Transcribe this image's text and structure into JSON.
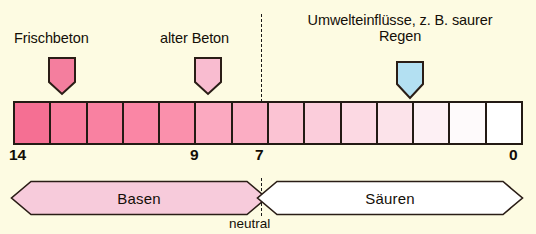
{
  "figure": {
    "background_color": "#fdfbe2",
    "ink_color": "#231a14"
  },
  "callouts": [
    {
      "id": "frischbeton",
      "label": "Frischbeton",
      "marker_icon": "down-pointer-icon",
      "marker_color": "#f47e9e",
      "ph_position": 12.5
    },
    {
      "id": "alter-beton",
      "label": "alter Beton",
      "marker_icon": "down-pointer-icon",
      "marker_color": "#f9bcd0",
      "ph_position": 8.5
    },
    {
      "id": "umwelteinfluesse",
      "label": "Umwelteinflüsse, z. B. saurer Regen",
      "marker_icon": "down-pointer-icon",
      "marker_color": "#b3e0f2",
      "ph_position": 3.5
    }
  ],
  "scale": {
    "name": "ph-scale",
    "cell_count": 14,
    "cells": [
      {
        "ph_label": "14",
        "color": "#f56f93"
      },
      {
        "ph_label": "13",
        "color": "#f87b9c"
      },
      {
        "ph_label": "12",
        "color": "#f981a1"
      },
      {
        "ph_label": "11",
        "color": "#fa86a5"
      },
      {
        "ph_label": "10",
        "color": "#fa90ac"
      },
      {
        "ph_label": "9",
        "color": "#fba9c0"
      },
      {
        "ph_label": "8",
        "color": "#fbadc3"
      },
      {
        "ph_label": "7",
        "color": "#fbc3d3"
      },
      {
        "ph_label": "6",
        "color": "#fbcddb"
      },
      {
        "ph_label": "5",
        "color": "#fcd9e3"
      },
      {
        "ph_label": "4",
        "color": "#fce3ea"
      },
      {
        "ph_label": "3",
        "color": "#fdf0f4"
      },
      {
        "ph_label": "2",
        "color": "#fefafb"
      },
      {
        "ph_label": "1",
        "color": "#ffffff"
      }
    ],
    "tick_labels": [
      {
        "id": "tick-14",
        "value": "14"
      },
      {
        "id": "tick-9",
        "value": "9"
      },
      {
        "id": "tick-7",
        "value": "7"
      },
      {
        "id": "tick-0",
        "value": "0"
      }
    ]
  },
  "bands": {
    "basen": {
      "label": "Basen",
      "fill_color": "#f7cbdb",
      "range": "14 bis 7"
    },
    "sauren": {
      "label": "Säuren",
      "fill_color": "#ffffff",
      "range": "7 bis 0"
    },
    "neutral_label": "neutral"
  }
}
